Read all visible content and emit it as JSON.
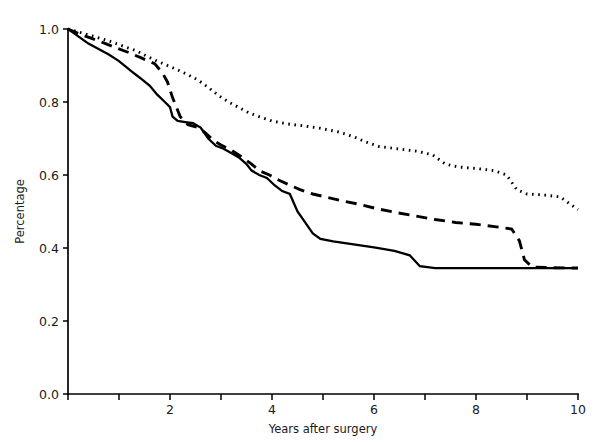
{
  "chart_data": {
    "type": "line",
    "title": "",
    "subtitle": "",
    "xlabel": "Years after surgery",
    "ylabel": "Percentage",
    "xlim": [
      0,
      10
    ],
    "ylim": [
      0.0,
      1.0
    ],
    "grid": false,
    "legend_position": "none",
    "x_ticks": [
      0,
      1,
      2,
      3,
      4,
      5,
      6,
      7,
      8,
      9,
      10
    ],
    "x_tick_labels": [
      "",
      "",
      "2",
      "",
      "4",
      "",
      "6",
      "",
      "8",
      "",
      "10"
    ],
    "y_ticks": [
      0.0,
      0.2,
      0.4,
      0.6,
      0.8,
      1.0
    ],
    "y_tick_labels": [
      "0.0",
      "0.2",
      "0.4",
      "0.6",
      "0.8",
      "1.0"
    ],
    "series": [
      {
        "name": "solid-curve",
        "style": "solid",
        "color": "#000000",
        "points": [
          [
            0.0,
            1.0
          ],
          [
            0.1,
            0.99
          ],
          [
            0.25,
            0.975
          ],
          [
            0.4,
            0.96
          ],
          [
            0.6,
            0.945
          ],
          [
            0.8,
            0.93
          ],
          [
            1.0,
            0.912
          ],
          [
            1.15,
            0.895
          ],
          [
            1.3,
            0.878
          ],
          [
            1.45,
            0.862
          ],
          [
            1.6,
            0.845
          ],
          [
            1.75,
            0.82
          ],
          [
            1.9,
            0.8
          ],
          [
            2.0,
            0.786
          ],
          [
            2.05,
            0.76
          ],
          [
            2.15,
            0.748
          ],
          [
            2.3,
            0.745
          ],
          [
            2.45,
            0.742
          ],
          [
            2.6,
            0.73
          ],
          [
            2.75,
            0.7
          ],
          [
            2.9,
            0.68
          ],
          [
            3.05,
            0.672
          ],
          [
            3.2,
            0.66
          ],
          [
            3.35,
            0.648
          ],
          [
            3.5,
            0.63
          ],
          [
            3.6,
            0.612
          ],
          [
            3.75,
            0.6
          ],
          [
            3.9,
            0.592
          ],
          [
            4.05,
            0.572
          ],
          [
            4.2,
            0.556
          ],
          [
            4.35,
            0.548
          ],
          [
            4.5,
            0.5
          ],
          [
            4.65,
            0.47
          ],
          [
            4.8,
            0.44
          ],
          [
            4.95,
            0.425
          ],
          [
            5.2,
            0.418
          ],
          [
            5.6,
            0.41
          ],
          [
            6.0,
            0.402
          ],
          [
            6.4,
            0.392
          ],
          [
            6.7,
            0.38
          ],
          [
            6.9,
            0.35
          ],
          [
            7.2,
            0.345
          ],
          [
            7.6,
            0.345
          ],
          [
            8.0,
            0.345
          ],
          [
            8.5,
            0.345
          ],
          [
            9.0,
            0.345
          ],
          [
            9.5,
            0.345
          ],
          [
            10.0,
            0.345
          ]
        ]
      },
      {
        "name": "dashed-curve",
        "style": "dashed",
        "color": "#000000",
        "points": [
          [
            0.0,
            1.0
          ],
          [
            0.2,
            0.988
          ],
          [
            0.45,
            0.975
          ],
          [
            0.7,
            0.962
          ],
          [
            0.95,
            0.948
          ],
          [
            1.2,
            0.935
          ],
          [
            1.45,
            0.92
          ],
          [
            1.7,
            0.905
          ],
          [
            1.85,
            0.88
          ],
          [
            1.95,
            0.855
          ],
          [
            2.05,
            0.812
          ],
          [
            2.2,
            0.76
          ],
          [
            2.35,
            0.738
          ],
          [
            2.55,
            0.73
          ],
          [
            2.7,
            0.715
          ],
          [
            2.85,
            0.695
          ],
          [
            3.0,
            0.682
          ],
          [
            3.2,
            0.668
          ],
          [
            3.4,
            0.65
          ],
          [
            3.6,
            0.63
          ],
          [
            3.75,
            0.612
          ],
          [
            3.95,
            0.6
          ],
          [
            4.15,
            0.585
          ],
          [
            4.35,
            0.572
          ],
          [
            4.55,
            0.56
          ],
          [
            4.8,
            0.548
          ],
          [
            5.05,
            0.54
          ],
          [
            5.35,
            0.53
          ],
          [
            5.7,
            0.52
          ],
          [
            6.05,
            0.508
          ],
          [
            6.4,
            0.498
          ],
          [
            6.8,
            0.488
          ],
          [
            7.2,
            0.478
          ],
          [
            7.6,
            0.47
          ],
          [
            8.0,
            0.465
          ],
          [
            8.4,
            0.458
          ],
          [
            8.7,
            0.452
          ],
          [
            8.85,
            0.42
          ],
          [
            8.95,
            0.368
          ],
          [
            9.1,
            0.348
          ],
          [
            9.5,
            0.346
          ],
          [
            10.0,
            0.345
          ]
        ]
      },
      {
        "name": "dotted-curve",
        "style": "dotted",
        "color": "#000000",
        "points": [
          [
            0.0,
            1.0
          ],
          [
            0.25,
            0.99
          ],
          [
            0.55,
            0.978
          ],
          [
            0.85,
            0.965
          ],
          [
            1.1,
            0.952
          ],
          [
            1.35,
            0.94
          ],
          [
            1.55,
            0.925
          ],
          [
            1.75,
            0.912
          ],
          [
            1.95,
            0.9
          ],
          [
            2.15,
            0.888
          ],
          [
            2.35,
            0.875
          ],
          [
            2.55,
            0.86
          ],
          [
            2.75,
            0.84
          ],
          [
            2.95,
            0.818
          ],
          [
            3.15,
            0.8
          ],
          [
            3.35,
            0.785
          ],
          [
            3.55,
            0.77
          ],
          [
            3.75,
            0.76
          ],
          [
            4.0,
            0.748
          ],
          [
            4.3,
            0.74
          ],
          [
            4.6,
            0.735
          ],
          [
            4.95,
            0.728
          ],
          [
            5.3,
            0.718
          ],
          [
            5.6,
            0.705
          ],
          [
            5.85,
            0.69
          ],
          [
            6.1,
            0.678
          ],
          [
            6.45,
            0.672
          ],
          [
            6.85,
            0.665
          ],
          [
            7.15,
            0.655
          ],
          [
            7.4,
            0.63
          ],
          [
            7.65,
            0.622
          ],
          [
            8.0,
            0.618
          ],
          [
            8.35,
            0.612
          ],
          [
            8.6,
            0.6
          ],
          [
            8.8,
            0.56
          ],
          [
            9.0,
            0.548
          ],
          [
            9.35,
            0.545
          ],
          [
            9.65,
            0.54
          ],
          [
            9.85,
            0.52
          ],
          [
            10.0,
            0.505
          ]
        ]
      }
    ]
  },
  "chart_meta": {
    "xlabel": "Years after surgery",
    "ylabel": "Percentage"
  }
}
